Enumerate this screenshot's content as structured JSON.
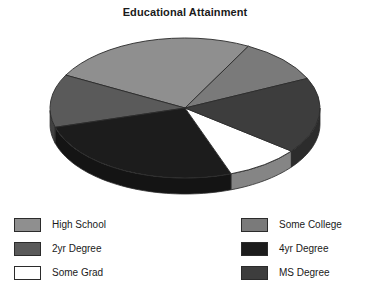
{
  "chart_data": {
    "type": "pie",
    "title": "Educational Attainment",
    "xlabel": "",
    "ylabel": "",
    "three_d": true,
    "legend_position": "bottom",
    "grid": false,
    "categories": [
      "High School",
      "Some College",
      "2yr Degree",
      "4yr Degree",
      "Some Grad",
      "MS Degree"
    ],
    "values": [
      25,
      10,
      12,
      26,
      9,
      18
    ],
    "colors": [
      "#8f8f8f",
      "#7a7a7a",
      "#5a5a5a",
      "#1c1c1c",
      "#ffffff",
      "#3d3d3d"
    ],
    "slices": [
      {
        "label": "High School",
        "value": 25,
        "color": "#8f8f8f",
        "start_angle": 62,
        "end_angle": 152
      },
      {
        "label": "Some College",
        "value": 10,
        "color": "#7a7a7a",
        "start_angle": 25,
        "end_angle": 62
      },
      {
        "label": "2yr Degree",
        "value": 12,
        "color": "#5a5a5a",
        "start_angle": 152,
        "end_angle": 196
      },
      {
        "label": "4yr Degree",
        "value": 26,
        "color": "#1c1c1c",
        "start_angle": 196,
        "end_angle": 290
      },
      {
        "label": "Some Grad",
        "value": 9,
        "color": "#ffffff",
        "start_angle": 290,
        "end_angle": 322
      },
      {
        "label": "MS Degree",
        "value": 18,
        "color": "#3d3d3d",
        "start_angle": 322,
        "end_angle": 385
      }
    ]
  },
  "title": {
    "text": "Educational Attainment"
  },
  "legend": {
    "columns": [
      {
        "items": [
          {
            "label": "High School",
            "color": "#8f8f8f"
          },
          {
            "label": "2yr Degree",
            "color": "#5a5a5a"
          },
          {
            "label": "Some Grad",
            "color": "#ffffff"
          }
        ]
      },
      {
        "items": [
          {
            "label": "Some College",
            "color": "#7a7a7a"
          },
          {
            "label": "4yr Degree",
            "color": "#1c1c1c"
          },
          {
            "label": "MS Degree",
            "color": "#3d3d3d"
          }
        ]
      }
    ]
  }
}
